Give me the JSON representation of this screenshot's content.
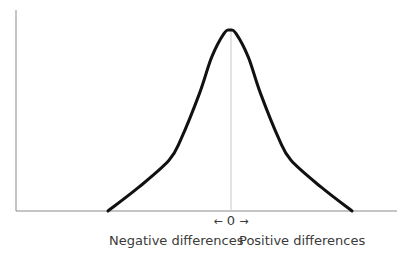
{
  "chart_data": {
    "type": "line",
    "title": "",
    "xlabel": "",
    "ylabel": "",
    "x_center_label": "0",
    "x_left_label": "Negative differences",
    "x_right_label": "Positive differences",
    "arrows": {
      "left": "←",
      "right": "→"
    },
    "grid": false,
    "legend": null,
    "x": [
      -1.0,
      -0.75,
      -0.5,
      -0.4,
      -0.25,
      -0.15,
      -0.05,
      0.0,
      0.05,
      0.15,
      0.25,
      0.4,
      0.5,
      0.75,
      1.0
    ],
    "values": [
      0.0,
      0.13,
      0.28,
      0.4,
      0.65,
      0.85,
      0.98,
      1.0,
      0.98,
      0.85,
      0.65,
      0.4,
      0.28,
      0.13,
      0.0
    ],
    "center_line": true
  },
  "colors": {
    "curve": "#111111",
    "axes": "#8a8a8a",
    "center_line": "#c8c8c8",
    "text": "#3a3a3a"
  }
}
